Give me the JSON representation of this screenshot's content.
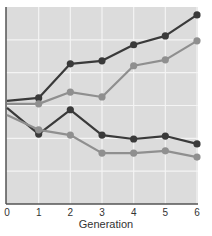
{
  "chart_data": {
    "type": "line",
    "title": "",
    "xlabel": "Generation",
    "ylabel": "",
    "x": [
      0,
      1,
      2,
      3,
      4,
      5,
      6
    ],
    "xtick_labels": [
      "0",
      "1",
      "2",
      "3",
      "4",
      "5",
      "6"
    ],
    "ylim": [
      0,
      6
    ],
    "grid": true,
    "legend": "none",
    "series": [
      {
        "name": "dark upper",
        "color": "#3a3a3a",
        "values": [
          3.14,
          3.23,
          4.27,
          4.36,
          4.85,
          5.12,
          5.76
        ]
      },
      {
        "name": "light upper",
        "color": "#8f8f8f",
        "values": [
          3.05,
          3.05,
          3.41,
          3.26,
          4.21,
          4.39,
          4.97
        ]
      },
      {
        "name": "dark lower",
        "color": "#3a3a3a",
        "values": [
          2.93,
          2.13,
          2.87,
          2.1,
          1.98,
          2.07,
          1.83
        ]
      },
      {
        "name": "light lower",
        "color": "#8f8f8f",
        "values": [
          2.71,
          2.26,
          2.1,
          1.55,
          1.55,
          1.62,
          1.43
        ]
      }
    ]
  },
  "colors": {
    "plot_bg": "#dcdcdc",
    "grid": "#f4f4f4",
    "axis": "#555555"
  }
}
